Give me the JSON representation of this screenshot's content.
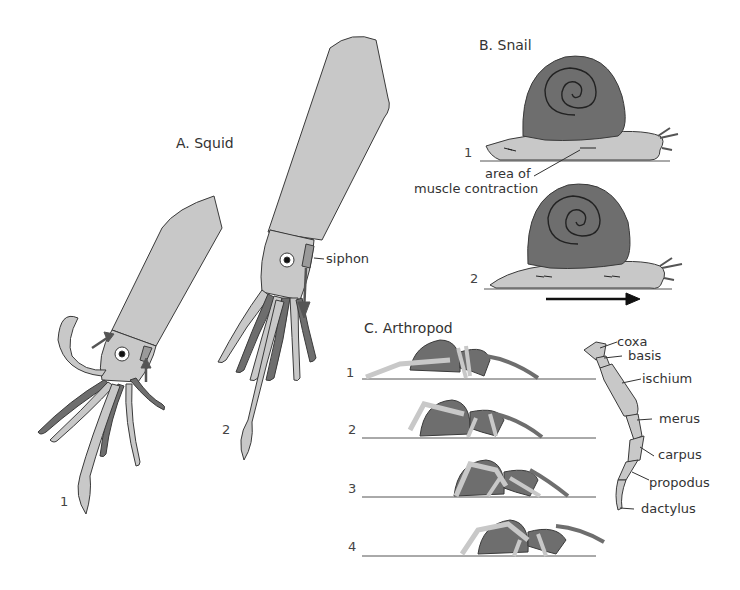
{
  "panels": {
    "squid": {
      "title": "A. Squid",
      "stages": [
        "1",
        "2"
      ],
      "labels": {
        "siphon": "siphon"
      }
    },
    "snail": {
      "title": "B. Snail",
      "stages": [
        "1",
        "2"
      ],
      "labels": {
        "contraction_line1": "area of",
        "contraction_line2": "muscle contraction"
      }
    },
    "arthropod": {
      "title": "C. Arthropod",
      "stages": [
        "1",
        "2",
        "3",
        "4"
      ],
      "leg_parts": [
        "coxa",
        "basis",
        "ischium",
        "merus",
        "carpus",
        "propodus",
        "dactylus"
      ]
    }
  },
  "colors": {
    "body_light": "#c8c8c8",
    "body_dark": "#6e6e6e",
    "outline": "#3a3a3a",
    "ground": "#555555"
  }
}
